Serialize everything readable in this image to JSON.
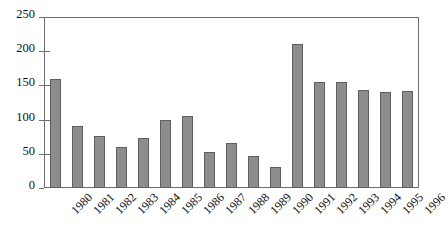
{
  "chart_data": {
    "type": "bar",
    "title": "",
    "subtitle": "",
    "xlabel": "",
    "ylabel": "",
    "categories": [
      "1980",
      "1981",
      "1982",
      "1983",
      "1984",
      "1985",
      "1986",
      "1987",
      "1988",
      "1989",
      "1990",
      "1991",
      "1992",
      "1993",
      "1994",
      "1995",
      "1996"
    ],
    "values": [
      160,
      91,
      76,
      60,
      73,
      100,
      105,
      53,
      66,
      47,
      31,
      210,
      155,
      155,
      143,
      140,
      142
    ],
    "series": [
      {
        "name": "",
        "values": [
          160,
          91,
          76,
          60,
          73,
          100,
          105,
          53,
          66,
          47,
          31,
          210,
          155,
          155,
          143,
          140,
          142
        ]
      }
    ],
    "ylim": [
      0,
      250
    ],
    "ytick_labels": [
      "0",
      "50",
      "100",
      "150",
      "200",
      "250"
    ],
    "ytick_values": [
      0,
      50,
      100,
      150,
      200,
      250
    ],
    "grid": false,
    "legend": false,
    "legend_position": "none",
    "bar_color": "#8d8d8d",
    "bar_edge_color": "#5f5f5f",
    "frame_color": "#6f6f6f",
    "background_color": "#ffffff",
    "xtick_rotation": 45
  }
}
